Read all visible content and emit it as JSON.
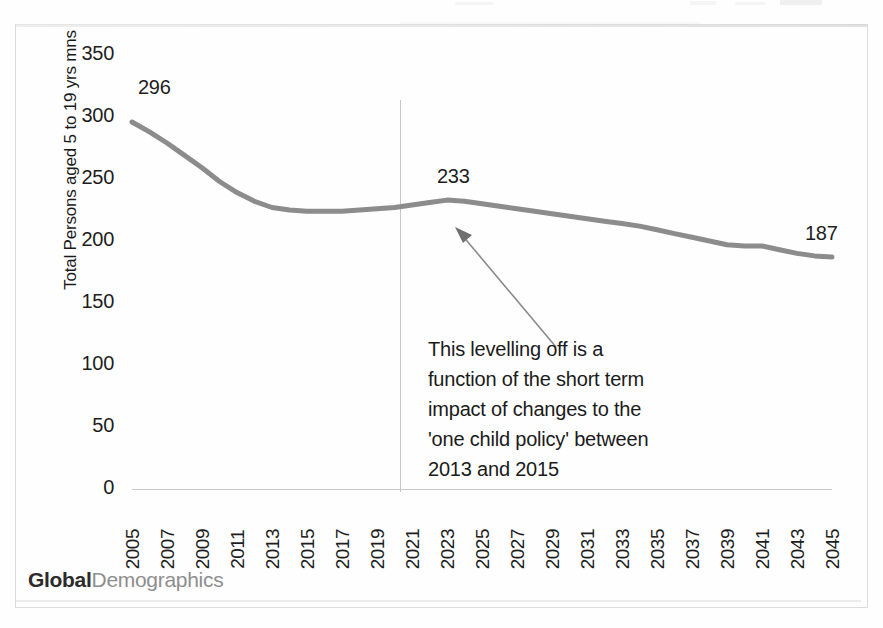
{
  "chart_data": {
    "type": "line",
    "title": "",
    "xlabel": "",
    "ylabel": "Total Persons aged 5 to 19 yrs  mns",
    "ylim": [
      0,
      350
    ],
    "yticks": [
      0,
      50,
      100,
      150,
      200,
      250,
      300,
      350
    ],
    "ytick_labels": [
      "0",
      "50",
      "100",
      "150",
      "200",
      "250",
      "300",
      "350"
    ],
    "xlim": [
      2005,
      2045
    ],
    "grid": false,
    "legend": "none",
    "categories": [
      "2005",
      "2006",
      "2007",
      "2008",
      "2009",
      "2010",
      "2011",
      "2012",
      "2013",
      "2014",
      "2015",
      "2016",
      "2017",
      "2018",
      "2019",
      "2020",
      "2021",
      "2022",
      "2023",
      "2024",
      "2025",
      "2026",
      "2027",
      "2028",
      "2029",
      "2030",
      "2031",
      "2032",
      "2033",
      "2034",
      "2035",
      "2036",
      "2037",
      "2038",
      "2039",
      "2040",
      "2041",
      "2042",
      "2043",
      "2044",
      "2045"
    ],
    "xtick_labels": [
      "2005",
      "2007",
      "2009",
      "2011",
      "2013",
      "2015",
      "2017",
      "2019",
      "2021",
      "2023",
      "2025",
      "2027",
      "2029",
      "2031",
      "2033",
      "2035",
      "2037",
      "2039",
      "2041",
      "2043",
      "2045"
    ],
    "series": [
      {
        "name": "Total Persons aged 5 to 19 yrs",
        "color": "#8c8c8c",
        "values": [
          296,
          288,
          279,
          269,
          259,
          248,
          239,
          232,
          227,
          225,
          224,
          224,
          224,
          225,
          226,
          227,
          229,
          231,
          233,
          232,
          230,
          228,
          226,
          224,
          222,
          220,
          218,
          216,
          214,
          212,
          209,
          206,
          203,
          200,
          197,
          196,
          196,
          193,
          190,
          188,
          187
        ]
      }
    ],
    "data_labels": [
      {
        "name": "start",
        "x": "2005",
        "value": "296"
      },
      {
        "name": "peak",
        "x": "2023",
        "value": "233"
      },
      {
        "name": "end",
        "x": "2045",
        "value": "187"
      }
    ],
    "reference_line": {
      "name": "forecast-divider",
      "x": "2020"
    },
    "annotations": [
      {
        "name": "levelling-off-note",
        "lines": [
          "This levelling off is a",
          "function of the short term",
          "impact of changes to the",
          "'one child policy' between",
          "2013 and 2015"
        ],
        "arrow_points_to": "2023"
      }
    ]
  },
  "brand": {
    "primary": "Global",
    "secondary": "Demographics"
  },
  "colors": {
    "line": "#8c8c8c",
    "axis": "#c9c9c9",
    "divider": "#c5c5c7",
    "text": "#1d1d1d",
    "brand_primary": "#2b2b2b",
    "brand_secondary": "#8e8e8e",
    "frame": "#dcdcdc"
  }
}
